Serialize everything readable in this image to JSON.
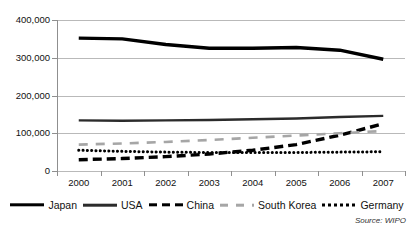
{
  "chart_data": {
    "type": "line",
    "title": "",
    "subtitle": "",
    "xlabel": "",
    "ylabel": "",
    "categories": [
      "2000",
      "2001",
      "2002",
      "2003",
      "2004",
      "2005",
      "2006",
      "2007"
    ],
    "ylim": [
      0,
      400000
    ],
    "yticks": [
      0,
      100000,
      200000,
      300000,
      400000
    ],
    "ytick_labels": [
      "0",
      "100,000",
      "200,000",
      "300,000",
      "400,000"
    ],
    "grid": true,
    "legend_position": "bottom",
    "series": [
      {
        "name": "Japan",
        "style": "solid-thick",
        "color": "#000000",
        "values": [
          352000,
          350000,
          335000,
          325000,
          325000,
          327000,
          320000,
          296000
        ]
      },
      {
        "name": "USA",
        "style": "solid",
        "color": "#2b2b2b",
        "values": [
          134000,
          133000,
          134000,
          135000,
          137000,
          139000,
          143000,
          146000
        ]
      },
      {
        "name": "China",
        "style": "dashed-thick",
        "color": "#000000",
        "values": [
          30000,
          33000,
          38000,
          45000,
          55000,
          70000,
          95000,
          125000
        ]
      },
      {
        "name": "South Korea",
        "style": "long-dash",
        "color": "#a6a6a6",
        "values": [
          70000,
          73000,
          77000,
          82000,
          88000,
          94000,
          100000,
          106000
        ]
      },
      {
        "name": "Germany",
        "style": "dotted",
        "color": "#000000",
        "values": [
          55000,
          52000,
          50000,
          49000,
          49000,
          49000,
          50000,
          51000
        ]
      }
    ],
    "annotations": [
      {
        "name": "source",
        "text": "Source: WIPO"
      }
    ]
  },
  "source": {
    "text": "Source: WIPO"
  }
}
